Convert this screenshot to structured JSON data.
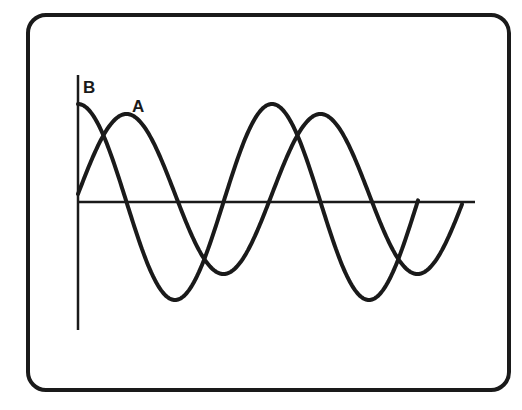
{
  "diagram": {
    "type": "oscilloscope-waveforms",
    "labels": {
      "curve_b": "B",
      "curve_a": "A"
    },
    "colors": {
      "stroke": "#1a1a1a",
      "background": "#ffffff"
    }
  },
  "chart_data": {
    "type": "line",
    "title": "",
    "xlabel": "",
    "ylabel": "",
    "grid": false,
    "series": [
      {
        "name": "B",
        "shape": "cosine",
        "description": "starts at positive peak, leads A by 90 degrees",
        "cycles": 2,
        "relative_amplitude": 1.0
      },
      {
        "name": "A",
        "shape": "sine",
        "description": "starts at zero, lags B by 90 degrees",
        "cycles": 2,
        "relative_amplitude": 0.85
      }
    ],
    "phase_difference_degrees": 90
  }
}
